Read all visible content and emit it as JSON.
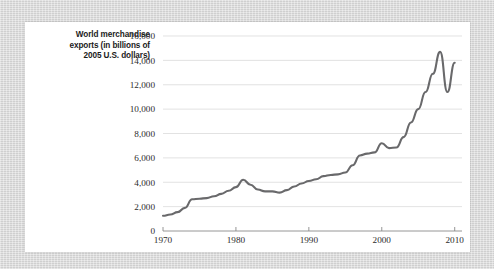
{
  "figure": {
    "y_axis_caption": "World merchandise exports (in billions of 2005 U.S. dollars)",
    "y_axis_caption_lines": [
      "World merchandise",
      "exports (in billions of",
      "2005 U.S. dollars)"
    ],
    "line_color": "#69696b",
    "grid_color": "#d6d6d6",
    "axis_color": "#8a8a8a",
    "card_background": "#ffffff",
    "page_background": "#d8d8d8"
  },
  "chart_data": {
    "type": "line",
    "title": "",
    "subtitle": "",
    "xlabel": "",
    "ylabel": "World merchandise exports (in billions of 2005 U.S. dollars)",
    "xlim": [
      1970,
      2011
    ],
    "ylim": [
      0,
      16000
    ],
    "grid": true,
    "grid_axis": "y",
    "legend": false,
    "legend_position": "none",
    "y_ticks": [
      0,
      2000,
      4000,
      6000,
      8000,
      10000,
      12000,
      14000,
      16000
    ],
    "y_tick_labels": [
      "0",
      "2,000",
      "4,000",
      "6,000",
      "8,000",
      "10,000",
      "12,000",
      "14,000",
      "16,000"
    ],
    "x_ticks": [
      1970,
      1980,
      1990,
      2000,
      2010
    ],
    "x_tick_labels": [
      "1970",
      "1980",
      "1990",
      "2000",
      "2010"
    ],
    "x": [
      1970,
      1971,
      1972,
      1973,
      1974,
      1975,
      1976,
      1977,
      1978,
      1979,
      1980,
      1981,
      1982,
      1983,
      1984,
      1985,
      1986,
      1987,
      1988,
      1989,
      1990,
      1991,
      1992,
      1993,
      1994,
      1995,
      1996,
      1997,
      1998,
      1999,
      2000,
      2001,
      2002,
      2003,
      2004,
      2005,
      2006,
      2007,
      2008,
      2009,
      2010
    ],
    "values": [
      1250,
      1350,
      1550,
      1900,
      2600,
      2650,
      2700,
      2850,
      3050,
      3300,
      3600,
      4200,
      3800,
      3400,
      3250,
      3250,
      3150,
      3350,
      3650,
      3900,
      4100,
      4250,
      4500,
      4600,
      4650,
      4800,
      5400,
      6200,
      6350,
      6450,
      7200,
      6800,
      6850,
      7700,
      8900,
      10000,
      11400,
      12900,
      14700,
      11400,
      13800
    ],
    "series": [
      {
        "name": "World merchandise exports",
        "values": [
          1250,
          1350,
          1550,
          1900,
          2600,
          2650,
          2700,
          2850,
          3050,
          3300,
          3600,
          4200,
          3800,
          3400,
          3250,
          3250,
          3150,
          3350,
          3650,
          3900,
          4100,
          4250,
          4500,
          4600,
          4650,
          4800,
          5400,
          6200,
          6350,
          6450,
          7200,
          6800,
          6850,
          7700,
          8900,
          10000,
          11400,
          12900,
          14700,
          11400,
          13800
        ]
      }
    ],
    "annotations": []
  }
}
